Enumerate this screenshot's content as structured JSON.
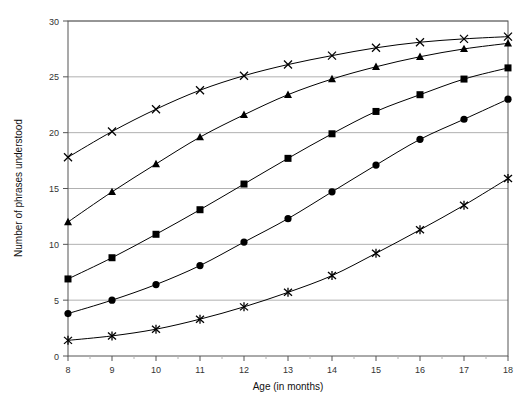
{
  "chart_data": {
    "type": "line",
    "title": "",
    "xlabel": "Age (in months)",
    "ylabel": "Number of phrases understood",
    "xlim": [
      8,
      18
    ],
    "ylim": [
      0,
      30
    ],
    "xticks": [
      8,
      9,
      10,
      11,
      12,
      13,
      14,
      15,
      16,
      17,
      18
    ],
    "yticks": [
      0,
      5,
      10,
      15,
      20,
      25,
      30
    ],
    "grid": "horizontal",
    "legend": "none",
    "x": [
      8,
      9,
      10,
      11,
      12,
      13,
      14,
      15,
      16,
      17,
      18
    ],
    "series": [
      {
        "name": "series-cross",
        "marker": "cross",
        "values": [
          17.8,
          20.1,
          22.1,
          23.8,
          25.1,
          26.1,
          26.9,
          27.6,
          28.1,
          28.4,
          28.6
        ]
      },
      {
        "name": "series-triangle",
        "marker": "triangle",
        "values": [
          12.0,
          14.7,
          17.2,
          19.6,
          21.6,
          23.4,
          24.8,
          25.9,
          26.8,
          27.5,
          28.0
        ]
      },
      {
        "name": "series-square",
        "marker": "square",
        "values": [
          6.9,
          8.8,
          10.9,
          13.1,
          15.4,
          17.7,
          19.9,
          21.9,
          23.4,
          24.8,
          25.8
        ]
      },
      {
        "name": "series-circle",
        "marker": "circle",
        "values": [
          3.8,
          5.0,
          6.4,
          8.1,
          10.2,
          12.3,
          14.7,
          17.1,
          19.4,
          21.2,
          23.0
        ]
      },
      {
        "name": "series-asterisk",
        "marker": "asterisk",
        "values": [
          1.4,
          1.8,
          2.4,
          3.3,
          4.4,
          5.7,
          7.2,
          9.2,
          11.3,
          13.5,
          15.9
        ]
      }
    ],
    "colors": {
      "line": "#000000",
      "marker": "#000000",
      "grid": "#b0b0b0",
      "frame": "#555555",
      "text": "#333333",
      "background": "#ffffff"
    }
  }
}
